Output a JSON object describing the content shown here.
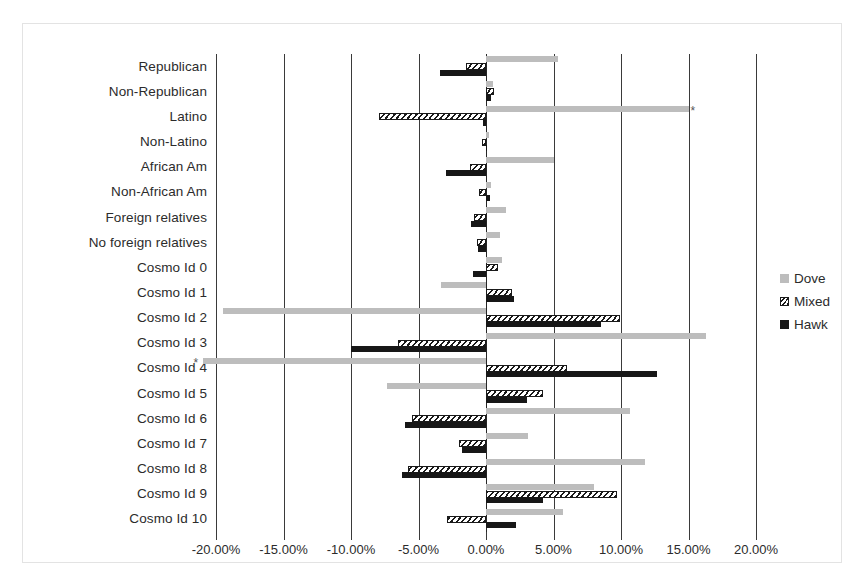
{
  "chart_data": {
    "type": "bar",
    "orientation": "horizontal",
    "title": "",
    "xlabel": "",
    "ylabel": "",
    "xlim": [
      -20,
      20
    ],
    "xticks": [
      -20,
      -15,
      -10,
      -5,
      0,
      5,
      10,
      15,
      20
    ],
    "xticklabels": [
      "-20.00%",
      "-15.00%",
      "-10.00%",
      "-5.00%",
      "0.00%",
      "5.00%",
      "10.00%",
      "15.00%",
      "20.00%"
    ],
    "grid": true,
    "legend_position": "right",
    "categories": [
      "Republican",
      "Non-Republican",
      "Latino",
      "Non-Latino",
      "African Am",
      "Non-African Am",
      "Foreign relatives",
      "No foreign relatives",
      "Cosmo Id 0",
      "Cosmo Id 1",
      "Cosmo Id 2",
      "Cosmo Id 3",
      "Cosmo Id 4",
      "Cosmo Id 5",
      "Cosmo Id 6",
      "Cosmo Id 7",
      "Cosmo Id 8",
      "Cosmo Id 9",
      "Cosmo Id 10"
    ],
    "series": [
      {
        "name": "Dove",
        "color": "#bdbdbd",
        "values": [
          5.3,
          0.5,
          15.0,
          0.2,
          5.0,
          0.4,
          1.5,
          1.0,
          1.2,
          -3.3,
          -19.5,
          16.3,
          -21.0,
          -7.3,
          10.7,
          3.1,
          11.8,
          8.0,
          5.7
        ]
      },
      {
        "name": "Mixed",
        "color": "#1a1a1a",
        "pattern": "diagonal-hatch",
        "values": [
          -1.5,
          0.6,
          -7.9,
          -0.3,
          -1.2,
          -0.5,
          -0.9,
          -0.7,
          0.9,
          1.9,
          9.9,
          -6.5,
          6.0,
          4.2,
          -5.5,
          -2.0,
          -5.8,
          9.7,
          -2.9
        ]
      },
      {
        "name": "Hawk",
        "color": "#171717",
        "values": [
          -3.4,
          0.4,
          -0.2,
          0.1,
          -3.0,
          0.3,
          -1.1,
          -0.6,
          -1.0,
          2.1,
          8.5,
          -10.0,
          12.7,
          3.0,
          -6.0,
          -1.8,
          -6.2,
          4.2,
          2.2
        ]
      }
    ],
    "annotations": [
      {
        "category": "Latino",
        "series": "Dove",
        "marker": "*",
        "side": "right"
      },
      {
        "category": "Cosmo Id 4",
        "series": "Dove",
        "marker": "*",
        "side": "left"
      }
    ]
  },
  "legend": {
    "items": [
      {
        "label": "Dove",
        "swatch": "dove"
      },
      {
        "label": "Mixed",
        "swatch": "mixed"
      },
      {
        "label": "Hawk",
        "swatch": "hawk"
      }
    ]
  }
}
